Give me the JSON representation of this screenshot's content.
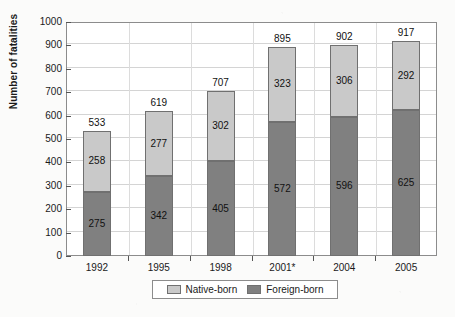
{
  "chart_data": {
    "type": "bar",
    "stacked": true,
    "title": "",
    "xlabel": "",
    "ylabel": "Number of fatalities",
    "ylim": [
      0,
      1000
    ],
    "ytick_step": 100,
    "yticks": [
      "1000",
      "900",
      "800",
      "700",
      "600",
      "500",
      "400",
      "300",
      "200",
      "100",
      "0"
    ],
    "grid": true,
    "legend_position": "bottom-center",
    "categories": [
      "1992",
      "1995",
      "1998",
      "2001*",
      "2004",
      "2005"
    ],
    "series": [
      {
        "name": "Foreign-born",
        "color": "#808080",
        "values": [
          275,
          342,
          405,
          572,
          596,
          625
        ]
      },
      {
        "name": "Native-born",
        "color": "#c9c9c9",
        "values": [
          258,
          277,
          302,
          323,
          306,
          292
        ]
      }
    ],
    "totals": [
      533,
      619,
      707,
      895,
      902,
      917
    ],
    "total_labels": [
      "533",
      "619",
      "707",
      "895",
      "902",
      "917"
    ],
    "native_labels": [
      "258",
      "277",
      "302",
      "323",
      "306",
      "292"
    ],
    "foreign_labels": [
      "275",
      "342",
      "405",
      "572",
      "596",
      "625"
    ]
  },
  "legend": {
    "entries": [
      {
        "label": "Native-born",
        "color": "#c9c9c9"
      },
      {
        "label": "Foreign-born",
        "color": "#808080"
      }
    ]
  }
}
